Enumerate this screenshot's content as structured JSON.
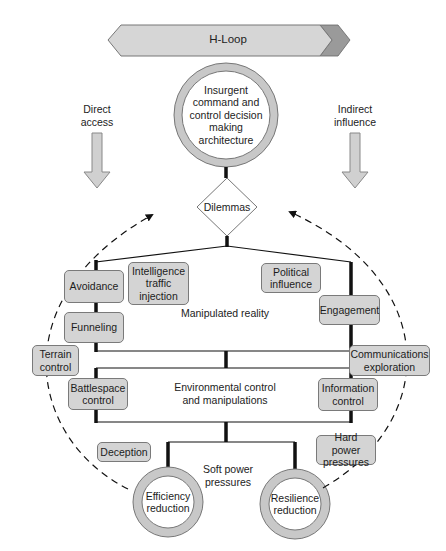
{
  "banner": {
    "label": "H-Loop"
  },
  "top_node": {
    "label": "Insurgent\ncommand and\ncontrol decision\nmaking\narchitecture"
  },
  "side_labels": {
    "direct_access": "Direct\naccess",
    "indirect_influence": "Indirect\ninfluence"
  },
  "decision": {
    "label": "Dilemmas"
  },
  "boxes": {
    "avoidance": "Avoidance",
    "intelligence": "Intelligence\ntraffic\ninjection",
    "political": "Political\ninfluence",
    "engagement": "Engagement",
    "funneling": "Funneling",
    "terrain": "Terrain\ncontrol",
    "communications": "Communications\nexploration",
    "battlespace": "Battlespace\ncontrol",
    "information": "Information\ncontrol",
    "deception": "Deception",
    "hard_power": "Hard power\npressures"
  },
  "region_labels": {
    "manipulated_reality": "Manipulated reality",
    "environmental": "Environmental control\nand manipulations",
    "soft_power": "Soft power\npressures"
  },
  "outcomes": {
    "efficiency": "Efficiency\nreduction",
    "resilience": "Resilience\nreduction"
  },
  "colors": {
    "box_fill": "#d4d4d4",
    "ring_fill": "#c8c8c8",
    "banner_fill": "#d6d6d6",
    "banner_tail": "#9a9a9a",
    "line": "#111111"
  }
}
